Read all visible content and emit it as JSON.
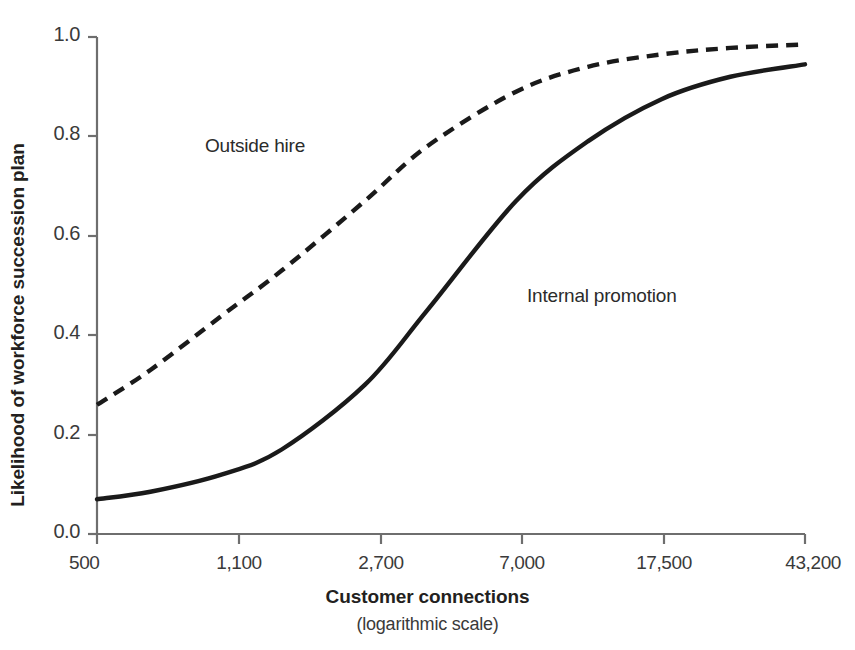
{
  "chart_data": {
    "type": "line",
    "title": "",
    "xlabel": "Customer connections",
    "xlabel_note": "(logarithmic scale)",
    "ylabel": "Likelihood of workforce succession plan",
    "x_scale": "log",
    "x_tick_labels": [
      "500",
      "1,100",
      "2,700",
      "7,000",
      "17,500",
      "43,200"
    ],
    "x_tick_values": [
      500,
      1100,
      2700,
      7000,
      17500,
      43200
    ],
    "xlim": [
      500,
      43200
    ],
    "y_tick_labels": [
      "0.0",
      "0.2",
      "0.4",
      "0.6",
      "0.8",
      "1.0"
    ],
    "y_tick_values": [
      0.0,
      0.2,
      0.4,
      0.6,
      0.8,
      1.0
    ],
    "ylim": [
      0.0,
      1.0
    ],
    "grid": false,
    "legend_position": "inline-annotations",
    "series": [
      {
        "name": "Outside hire",
        "style": "dashed",
        "color": "#1a1a1a",
        "x": [
          500,
          700,
          1100,
          1600,
          2700,
          4000,
          7000,
          11000,
          17500,
          27000,
          43200
        ],
        "values": [
          0.26,
          0.33,
          0.44,
          0.53,
          0.67,
          0.78,
          0.89,
          0.94,
          0.965,
          0.978,
          0.985
        ]
      },
      {
        "name": "Internal promotion",
        "style": "solid",
        "color": "#1a1a1a",
        "x": [
          500,
          700,
          1100,
          1600,
          2700,
          4000,
          7000,
          11000,
          17500,
          27000,
          43200
        ],
        "values": [
          0.07,
          0.085,
          0.12,
          0.17,
          0.3,
          0.45,
          0.67,
          0.79,
          0.875,
          0.92,
          0.945
        ]
      }
    ],
    "annotations": [
      {
        "text": "Outside hire",
        "x_px": 205,
        "y_px": 135
      },
      {
        "text": "Internal promotion",
        "x_px": 527,
        "y_px": 285
      }
    ]
  },
  "axis": {
    "y_ticks": [
      {
        "label": "1.0",
        "y_px": 37
      },
      {
        "label": "0.8",
        "y_px": 136
      },
      {
        "label": "0.6",
        "y_px": 236
      },
      {
        "label": "0.4",
        "y_px": 335
      },
      {
        "label": "0.2",
        "y_px": 435
      },
      {
        "label": "0.0",
        "y_px": 534
      }
    ],
    "x_ticks": [
      {
        "label": "500",
        "x_px": 97
      },
      {
        "label": "1,100",
        "x_px": 239
      },
      {
        "label": "2,700",
        "x_px": 381
      },
      {
        "label": "7,000",
        "x_px": 522
      },
      {
        "label": "17,500",
        "x_px": 664
      },
      {
        "label": "43,200",
        "x_px": 805
      }
    ]
  },
  "colors": {
    "axis": "#6e6e6e",
    "curve": "#1a1a1a",
    "text": "#231f20"
  }
}
